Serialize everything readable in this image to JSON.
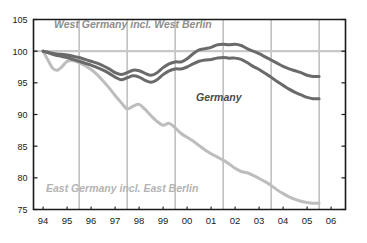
{
  "chart_data": {
    "type": "line",
    "title": "",
    "subtitle": "",
    "xlabel": "",
    "ylabel": "",
    "xlim": [
      93.6,
      106.6
    ],
    "ylim": [
      75,
      105
    ],
    "yticks": [
      75,
      80,
      85,
      90,
      95,
      100,
      105
    ],
    "xticks": [
      "94",
      "95",
      "96",
      "97",
      "98",
      "99",
      "00",
      "01",
      "02",
      "03",
      "04",
      "05",
      "06"
    ],
    "grid": "vertical gridlines at 95.5, 97.5, 99.5, 01.5, 03.5, 05.5; horizontal reference line at 100",
    "reference_line": 100,
    "legend": "inline annotations",
    "annotations": [
      {
        "text": "West Germany incl. West Berlin",
        "color": "#8e8e8e"
      },
      {
        "text": "Germany",
        "color": "#4a4a4a"
      },
      {
        "text": "East Germany incl. East Berlin",
        "color": "#b4b4b4"
      }
    ],
    "series": [
      {
        "name": "West Germany incl. West Berlin",
        "color": "#6a6a6a",
        "x": [
          94.0,
          94.25,
          94.5,
          94.75,
          95.0,
          95.25,
          95.5,
          95.75,
          96.0,
          96.25,
          96.5,
          96.75,
          97.0,
          97.25,
          97.5,
          97.75,
          98.0,
          98.25,
          98.5,
          98.75,
          99.0,
          99.25,
          99.5,
          99.75,
          100.0,
          100.25,
          100.5,
          100.75,
          101.0,
          101.25,
          101.5,
          101.75,
          102.0,
          102.25,
          102.5,
          102.75,
          103.0,
          103.25,
          103.5,
          103.75,
          104.0,
          104.25,
          104.5,
          104.75,
          105.0,
          105.25,
          105.5
        ],
        "values": [
          100.0,
          99.8,
          99.6,
          99.5,
          99.4,
          99.2,
          99.0,
          98.7,
          98.4,
          98.1,
          97.7,
          97.2,
          96.6,
          96.3,
          96.6,
          97.0,
          96.9,
          96.5,
          96.2,
          96.6,
          97.4,
          98.0,
          98.3,
          98.3,
          98.8,
          99.6,
          100.2,
          100.4,
          100.6,
          101.0,
          101.1,
          101.0,
          101.1,
          100.9,
          100.4,
          100.0,
          99.6,
          99.1,
          98.6,
          98.1,
          97.6,
          97.2,
          96.9,
          96.6,
          96.2,
          96.0,
          96.0
        ]
      },
      {
        "name": "Germany",
        "color": "#6a6a6a",
        "x": [
          94.0,
          94.25,
          94.5,
          94.75,
          95.0,
          95.25,
          95.5,
          95.75,
          96.0,
          96.25,
          96.5,
          96.75,
          97.0,
          97.25,
          97.5,
          97.75,
          98.0,
          98.25,
          98.5,
          98.75,
          99.0,
          99.25,
          99.5,
          99.75,
          100.0,
          100.25,
          100.5,
          100.75,
          101.0,
          101.25,
          101.5,
          101.75,
          102.0,
          102.25,
          102.5,
          102.75,
          103.0,
          103.25,
          103.5,
          103.75,
          104.0,
          104.25,
          104.5,
          104.75,
          105.0,
          105.25,
          105.5
        ],
        "values": [
          100.0,
          99.7,
          99.4,
          99.2,
          99.0,
          98.7,
          98.4,
          98.1,
          97.8,
          97.4,
          97.0,
          96.5,
          95.9,
          95.5,
          95.8,
          96.1,
          95.9,
          95.4,
          95.1,
          95.5,
          96.3,
          96.9,
          97.2,
          97.2,
          97.5,
          98.0,
          98.4,
          98.6,
          98.7,
          98.9,
          99.0,
          98.9,
          98.9,
          98.7,
          98.2,
          97.6,
          97.1,
          96.5,
          95.9,
          95.2,
          94.6,
          94.0,
          93.5,
          93.1,
          92.7,
          92.5,
          92.5
        ]
      },
      {
        "name": "East Germany incl. East Berlin",
        "color": "#bdbdbd",
        "x": [
          94.0,
          94.2,
          94.4,
          94.6,
          94.8,
          95.0,
          95.25,
          95.5,
          95.75,
          96.0,
          96.25,
          96.5,
          96.75,
          97.0,
          97.25,
          97.5,
          97.75,
          98.0,
          98.25,
          98.5,
          98.75,
          99.0,
          99.25,
          99.5,
          99.75,
          100.0,
          100.25,
          100.5,
          100.75,
          101.0,
          101.25,
          101.5,
          101.75,
          102.0,
          102.25,
          102.5,
          102.75,
          103.0,
          103.25,
          103.5,
          103.75,
          104.0,
          104.25,
          104.5,
          104.75,
          105.0,
          105.25,
          105.5
        ],
        "values": [
          100.0,
          98.6,
          97.3,
          97.0,
          97.6,
          98.4,
          98.5,
          98.2,
          97.7,
          97.1,
          96.3,
          95.3,
          94.2,
          93.0,
          91.9,
          90.9,
          91.3,
          91.6,
          90.8,
          89.8,
          88.9,
          88.3,
          88.6,
          87.9,
          87.0,
          86.4,
          85.8,
          85.1,
          84.4,
          83.8,
          83.3,
          82.8,
          82.2,
          81.5,
          81.0,
          80.8,
          80.4,
          79.9,
          79.4,
          78.8,
          78.1,
          77.5,
          77.0,
          76.6,
          76.3,
          76.1,
          76.0,
          76.0
        ]
      }
    ]
  },
  "annotations": {
    "west": "West Germany incl. West Berlin",
    "germany": "Germany",
    "east": "East Germany incl. East Berlin"
  },
  "axes": {
    "y_labels": [
      "105",
      "100",
      "95",
      "90",
      "85",
      "80",
      "75"
    ],
    "x_labels": [
      "94",
      "95",
      "96",
      "97",
      "98",
      "99",
      "00",
      "01",
      "02",
      "03",
      "04",
      "05",
      "06"
    ]
  },
  "colors": {
    "dark_series": "#6a6a6a",
    "light_series": "#bdbdbd",
    "reference_line": "#c8c8c8",
    "grid": "#9a9a9a",
    "axis": "#1a1a1a"
  }
}
